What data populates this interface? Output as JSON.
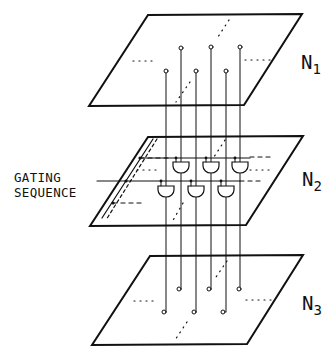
{
  "diagram": {
    "labels": {
      "gating_line1": "GATING",
      "gating_line2": "SEQUENCE",
      "n1_base": "N",
      "n1_sub": "1",
      "n2_base": "N",
      "n2_sub": "2",
      "n3_base": "N",
      "n3_sub": "3"
    },
    "planes": [
      {
        "name": "N1",
        "corners": [
          [
            148,
            15
          ],
          [
            302,
            14
          ],
          [
            244,
            105
          ],
          [
            89,
            106
          ]
        ]
      },
      {
        "name": "N2",
        "corners": [
          [
            148,
            137
          ],
          [
            303,
            136
          ],
          [
            246,
            225
          ],
          [
            90,
            226
          ]
        ]
      },
      {
        "name": "N3",
        "corners": [
          [
            150,
            256
          ],
          [
            303,
            255
          ],
          [
            247,
            344
          ],
          [
            92,
            345
          ]
        ]
      }
    ],
    "connections": {
      "back_row_x": [
        181,
        211,
        240
      ],
      "front_row_x": [
        166,
        196,
        226
      ],
      "stroke_color": "#111111"
    }
  }
}
